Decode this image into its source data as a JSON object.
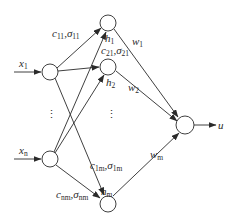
{
  "diagram": {
    "type": "RBF neural network",
    "colors": {
      "stroke": "#2a2a2a",
      "background": "#ffffff"
    },
    "inputs": [
      {
        "id": "x1",
        "label": "x",
        "sub": "1"
      },
      {
        "id": "xn",
        "label": "x",
        "sub": "n"
      }
    ],
    "hidden": [
      {
        "id": "h1",
        "label": "h",
        "sub": "1"
      },
      {
        "id": "h2",
        "label": "h",
        "sub": "2"
      },
      {
        "id": "hm",
        "label": "h",
        "sub": "m"
      }
    ],
    "output": {
      "id": "u",
      "label": "u"
    },
    "edge_labels": {
      "c11": {
        "c": "c",
        "csub": "11",
        "s": "σ",
        "ssub": "11"
      },
      "c21": {
        "c": "c",
        "csub": "21",
        "s": "σ",
        "ssub": "21"
      },
      "c1m": {
        "c": "c",
        "csub": "1m",
        "s": "σ",
        "ssub": "1m"
      },
      "cnm": {
        "c": "c",
        "csub": "nm",
        "s": "σ",
        "ssub": "nm"
      }
    },
    "weights": [
      {
        "label": "w",
        "sub": "1"
      },
      {
        "label": "w",
        "sub": "2"
      },
      {
        "label": "w",
        "sub": "m"
      }
    ],
    "ellipsis": "⋮"
  }
}
